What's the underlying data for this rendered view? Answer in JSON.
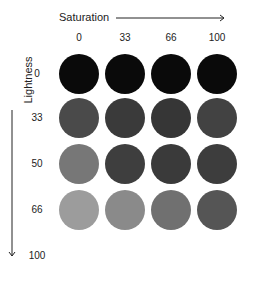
{
  "x_axis": {
    "label": "Saturation",
    "ticks": [
      "0",
      "33",
      "66",
      "100"
    ]
  },
  "y_axis": {
    "label": "Lightness",
    "ticks": [
      "0",
      "33",
      "50",
      "66",
      "100"
    ]
  },
  "grid": {
    "rows": [
      {
        "lightness": "0",
        "colors": [
          "#0a0a0a",
          "#0a0a0a",
          "#0a0a0a",
          "#0a0a0a"
        ]
      },
      {
        "lightness": "33",
        "colors": [
          "#4a4a4a",
          "#3a3a3a",
          "#363636",
          "#424242"
        ]
      },
      {
        "lightness": "50",
        "colors": [
          "#777777",
          "#3e3e3e",
          "#3a3a3a",
          "#3d3d3d"
        ]
      },
      {
        "lightness": "66",
        "colors": [
          "#9c9c9c",
          "#8a8a8a",
          "#707070",
          "#555555"
        ]
      }
    ]
  }
}
